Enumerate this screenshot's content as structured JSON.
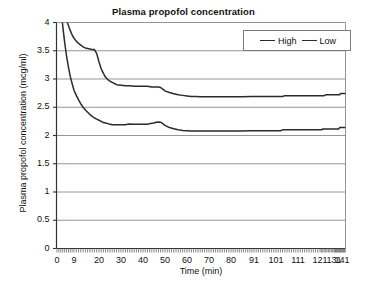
{
  "chart_data": {
    "type": "line",
    "title": "Plasma propofol concentration",
    "xlabel": "Time (min)",
    "ylabel": "Plasma propofol concentration (mcg/ml)",
    "xlim": [
      0,
      148
    ],
    "ylim": [
      0,
      4
    ],
    "grid": "horizontal",
    "legend_position": "top-right",
    "y_ticks": [
      "0",
      "0.5",
      "1",
      "1.5",
      "2",
      "2.5",
      "3",
      "3.5",
      "4"
    ],
    "y_tick_values": [
      0,
      0.5,
      1,
      1.5,
      2,
      2.5,
      3,
      3.5,
      4
    ],
    "x_ticks": [
      "0",
      "9",
      "20",
      "30",
      "40",
      "50",
      "60",
      "70",
      "80",
      "91",
      "101",
      "111",
      "121",
      "131",
      "141"
    ],
    "x_tick_values": [
      0,
      9,
      20,
      30,
      40,
      50,
      60,
      70,
      80,
      91,
      101,
      111,
      121,
      131,
      141
    ],
    "series": [
      {
        "name": "High",
        "color": "#2b2b2b",
        "x": [
          3,
          4,
          5,
          6,
          7,
          8,
          9,
          10,
          11,
          12,
          13,
          14,
          15,
          16,
          17,
          18,
          19,
          20,
          21,
          22,
          23,
          24,
          25,
          26,
          27,
          28,
          30,
          32,
          34,
          36,
          38,
          40,
          42,
          44,
          46,
          47,
          48,
          49,
          50,
          52,
          54,
          56,
          58,
          60,
          62,
          64,
          66,
          68,
          70,
          75,
          80,
          85,
          90,
          95,
          100,
          104,
          105,
          110,
          115,
          120,
          124,
          125,
          130,
          135,
          138,
          139,
          142,
          145,
          148
        ],
        "y": [
          4.35,
          4.2,
          4.05,
          3.95,
          3.86,
          3.78,
          3.72,
          3.67,
          3.63,
          3.6,
          3.57,
          3.55,
          3.54,
          3.53,
          3.52,
          3.52,
          3.45,
          3.3,
          3.18,
          3.1,
          3.03,
          2.99,
          2.96,
          2.94,
          2.92,
          2.9,
          2.89,
          2.88,
          2.88,
          2.87,
          2.87,
          2.87,
          2.87,
          2.86,
          2.86,
          2.86,
          2.85,
          2.82,
          2.79,
          2.76,
          2.74,
          2.72,
          2.71,
          2.7,
          2.69,
          2.69,
          2.685,
          2.685,
          2.685,
          2.685,
          2.685,
          2.685,
          2.69,
          2.69,
          2.69,
          2.69,
          2.705,
          2.705,
          2.705,
          2.705,
          2.705,
          2.72,
          2.72,
          2.72,
          2.72,
          2.745,
          2.745,
          2.745,
          2.745
        ]
      },
      {
        "name": "Low",
        "color": "#2b2b2b",
        "x": [
          2,
          3,
          4,
          5,
          6,
          7,
          8,
          9,
          10,
          11,
          12,
          13,
          14,
          15,
          16,
          17,
          18,
          19,
          20,
          21,
          22,
          23,
          24,
          25,
          26,
          28,
          30,
          32,
          33,
          34,
          35,
          36,
          38,
          40,
          42,
          43,
          44,
          45,
          46,
          47,
          48,
          49,
          50,
          52,
          54,
          56,
          58,
          60,
          62,
          64,
          66,
          68,
          70,
          75,
          80,
          85,
          90,
          95,
          100,
          103,
          104,
          110,
          115,
          120,
          122,
          123,
          130,
          135,
          137,
          138,
          142,
          145,
          148
        ],
        "y": [
          4.3,
          3.95,
          3.66,
          3.42,
          3.22,
          3.05,
          2.92,
          2.8,
          2.71,
          2.63,
          2.56,
          2.5,
          2.45,
          2.41,
          2.37,
          2.34,
          2.31,
          2.29,
          2.27,
          2.25,
          2.23,
          2.22,
          2.21,
          2.2,
          2.19,
          2.19,
          2.19,
          2.19,
          2.2,
          2.205,
          2.2,
          2.2,
          2.2,
          2.2,
          2.2,
          2.21,
          2.215,
          2.22,
          2.235,
          2.24,
          2.235,
          2.21,
          2.18,
          2.14,
          2.12,
          2.1,
          2.09,
          2.085,
          2.08,
          2.08,
          2.08,
          2.08,
          2.08,
          2.08,
          2.08,
          2.08,
          2.085,
          2.085,
          2.085,
          2.085,
          2.1,
          2.1,
          2.1,
          2.1,
          2.1,
          2.115,
          2.115,
          2.115,
          2.115,
          2.14,
          2.14,
          2.14,
          2.14
        ]
      }
    ]
  },
  "legend": {
    "entries": [
      {
        "label": "High"
      },
      {
        "label": "Low"
      }
    ]
  }
}
